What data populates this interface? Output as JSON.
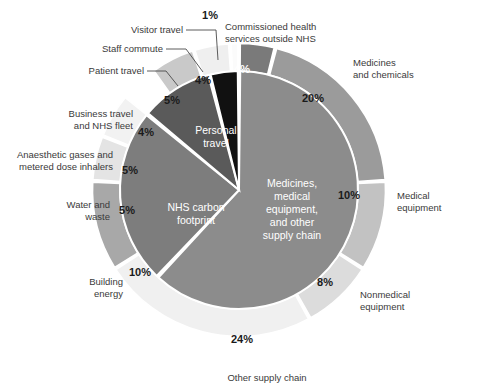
{
  "chart_data": {
    "type": "pie",
    "title": "",
    "subtitle": "",
    "xlabel": "",
    "ylabel": "",
    "legend_position": "none",
    "grid": false,
    "units": "percent of NHS carbon footprint plus",
    "rings": [
      {
        "name": "inner",
        "description": "Inner pie: three top-level groupings",
        "segments": [
          {
            "label": "Medicines, medical equipment, and other supply chain",
            "value": 62,
            "color": "#8c8c8c",
            "label_position": "inside",
            "label_color": "#ffffff"
          },
          {
            "label": "NHS carbon footprint",
            "value": 24,
            "color": "#7d7d7d",
            "label_position": "inside",
            "label_color": "#ffffff"
          },
          {
            "label": "Personal travel",
            "value": 10,
            "color": "#5a5a5a",
            "label_position": "inside",
            "label_color": "#ffffff"
          },
          {
            "label": "",
            "value": 4,
            "color": "#111111",
            "label_position": "none",
            "label_color": "#ffffff"
          }
        ]
      },
      {
        "name": "outer",
        "description": "Outer ring: component categories, clockwise from 12 o'clock",
        "segments": [
          {
            "label": "Commissioned health services outside NHS",
            "value": 4,
            "display": "4%",
            "color": "#7a7a7a",
            "pct_color": "#ffffff"
          },
          {
            "label": "Medicines and chemicals",
            "value": 20,
            "display": "20%",
            "color": "#9b9b9b",
            "pct_color": "#1a1a1a"
          },
          {
            "label": "Medical equipment",
            "value": 10,
            "display": "10%",
            "color": "#c2c2c2",
            "pct_color": "#1a1a1a"
          },
          {
            "label": "Nonmedical equipment",
            "value": 8,
            "display": "8%",
            "color": "#dcdcdc",
            "pct_color": "#1a1a1a"
          },
          {
            "label": "Other supply chain",
            "value": 24,
            "display": "24%",
            "color": "#f0f0f0",
            "pct_color": "#1a1a1a"
          },
          {
            "label": "Building energy",
            "value": 10,
            "display": "10%",
            "color": "#a8a8a8",
            "pct_color": "#1a1a1a"
          },
          {
            "label": "Water and waste",
            "value": 5,
            "display": "5%",
            "color": "#e4e4e4",
            "pct_color": "#1a1a1a"
          },
          {
            "label": "Anaesthetic gases and metered dose inhalers",
            "value": 5,
            "display": "5%",
            "color": "#f2f2f2",
            "pct_color": "#1a1a1a"
          },
          {
            "label": "Business travel and NHS fleet",
            "value": 4,
            "display": "4%",
            "color": "#ffffff",
            "pct_color": "#1a1a1a"
          },
          {
            "label": "Patient travel",
            "value": 5,
            "display": "5%",
            "color": "#c9c9c9",
            "pct_color": "#1a1a1a"
          },
          {
            "label": "Staff commute",
            "value": 4,
            "display": "4%",
            "color": "#efefef",
            "pct_color": "#1a1a1a"
          },
          {
            "label": "Visitor travel",
            "value": 1,
            "display": "1%",
            "color": "#fbfbfb",
            "pct_color": "#1a1a1a"
          }
        ]
      }
    ]
  },
  "labels": {
    "visitor_travel": "Visitor travel",
    "staff_commute": "Staff commute",
    "patient_travel": "Patient travel",
    "business_travel_l1": "Business travel",
    "business_travel_l2": "and NHS fleet",
    "anaesthetic_l1": "Anaesthetic gases and",
    "anaesthetic_l2": "metered dose inhalers",
    "water_waste_l1": "Water and",
    "water_waste_l2": "waste",
    "building_energy_l1": "Building",
    "building_energy_l2": "energy",
    "other_supply_chain": "Other supply chain",
    "nonmedical_l1": "Nonmedical",
    "nonmedical_l2": "equipment",
    "medical_equipment_l1": "Medical",
    "medical_equipment_l2": "equipment",
    "medicines_chem_l1": "Medicines",
    "medicines_chem_l2": "and chemicals",
    "commissioned_l1": "Commissioned health",
    "commissioned_l2": "services outside NHS"
  },
  "percentages": {
    "visitor_travel": "1%",
    "staff_commute": "4%",
    "patient_travel": "5%",
    "business_travel": "4%",
    "anaesthetic": "5%",
    "water_waste": "5%",
    "building_energy": "10%",
    "other_supply_chain": "24%",
    "nonmedical": "8%",
    "medical_equipment": "10%",
    "medicines_chem": "20%",
    "commissioned": "4%"
  },
  "inner_labels": {
    "nhs_l1": "NHS carbon",
    "nhs_l2": "footprint",
    "personal_l1": "Personal",
    "personal_l2": "travel",
    "supply_l1": "Medicines,",
    "supply_l2": "medical",
    "supply_l3": "equipment,",
    "supply_l4": "and other",
    "supply_l5": "supply chain"
  }
}
